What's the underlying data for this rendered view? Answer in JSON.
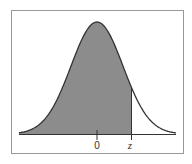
{
  "chart_data": {
    "type": "area",
    "title": "",
    "xlabel": "",
    "ylabel": "",
    "tick_labels": [
      "0",
      "z"
    ],
    "shaded_region": "left of z",
    "shade_color": "#888888",
    "curve_color": "#333333"
  },
  "labels": {
    "zero": "0",
    "z": "z"
  }
}
